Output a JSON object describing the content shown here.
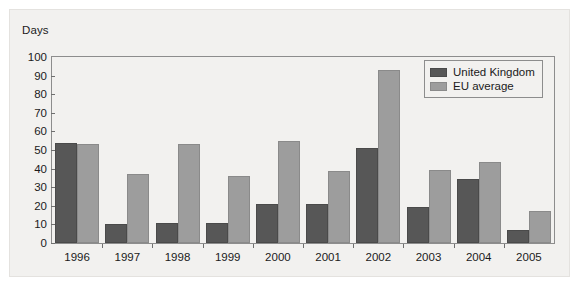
{
  "chart_data": {
    "type": "bar",
    "title": "",
    "subtitle": "",
    "xlabel": "",
    "ylabel": "Days",
    "ylim": [
      0,
      100
    ],
    "yticks": [
      0,
      10,
      20,
      30,
      40,
      50,
      60,
      70,
      80,
      90,
      100
    ],
    "grid": false,
    "legend_position": "top-right",
    "categories": [
      "1996",
      "1997",
      "1998",
      "1999",
      "2000",
      "2001",
      "2002",
      "2003",
      "2004",
      "2005"
    ],
    "series": [
      {
        "name": "United Kingdom",
        "color": "#575757",
        "values": [
          54,
          10,
          11,
          10.5,
          21,
          21,
          51,
          19.5,
          34.5,
          7
        ]
      },
      {
        "name": "EU average",
        "color": "#9d9d9d",
        "values": [
          53,
          37,
          53,
          36,
          55,
          38.5,
          93,
          39.5,
          43.5,
          17
        ]
      }
    ]
  },
  "legend": {
    "items": [
      {
        "label": "United Kingdom",
        "key": "uk"
      },
      {
        "label": "EU average",
        "key": "eu"
      }
    ]
  },
  "colors": {
    "united_kingdom": "#575757",
    "eu_average": "#9d9d9d",
    "panel_background": "#f2f1ef",
    "axis_line": "#8d8d8d",
    "text": "#1b1b1b"
  }
}
